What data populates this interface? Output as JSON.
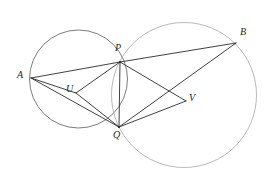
{
  "figure": {
    "name": "two-intersecting-circles-diagram",
    "background_color": "#ffffff",
    "width": 272,
    "height": 187
  },
  "style": {
    "circle_left_color": "#5a5a5a",
    "circle_right_color": "#a8a8a8",
    "chord_color": "#2b2b2b",
    "label_color": "#231f20",
    "circle_stroke_width": 0.8,
    "chord_stroke_width": 0.9,
    "label_font_size": 10
  },
  "circles": [
    {
      "id": "circle-left",
      "label": "left circle",
      "cx": 78.5,
      "cy": 79.0,
      "r": 49.0,
      "color": "#5a5a5a"
    },
    {
      "id": "circle-right",
      "label": "right circle",
      "cx": 184.0,
      "cy": 95.0,
      "r": 72.5,
      "color": "#a8a8a8"
    }
  ],
  "points": [
    {
      "id": "A",
      "label": "A",
      "x": 31.0,
      "y": 78.0,
      "label_x": 17,
      "label_y": 70
    },
    {
      "id": "P",
      "label": "P",
      "x": 120.0,
      "y": 62.0,
      "label_x": 115,
      "label_y": 43
    },
    {
      "id": "Q",
      "label": "Q",
      "x": 119.0,
      "y": 127.0,
      "label_x": 113,
      "label_y": 130
    },
    {
      "id": "B",
      "label": "B",
      "x": 236.0,
      "y": 43.0,
      "label_x": 240,
      "label_y": 27
    },
    {
      "id": "U",
      "label": "U",
      "x": 76.0,
      "y": 93.0,
      "label_x": 66,
      "label_y": 84
    },
    {
      "id": "V",
      "label": "V",
      "x": 186.0,
      "y": 101.0,
      "label_x": 189,
      "label_y": 93
    }
  ],
  "segments": [
    {
      "id": "seg-AP",
      "from": "A",
      "to": "P",
      "label": "A to P"
    },
    {
      "id": "seg-AU",
      "from": "A",
      "to": "U",
      "label": "A to U"
    },
    {
      "id": "seg-AQ",
      "from": "A",
      "to": "Q",
      "label": "A to Q"
    },
    {
      "id": "seg-UP",
      "from": "U",
      "to": "P",
      "label": "U to P"
    },
    {
      "id": "seg-UQ",
      "from": "U",
      "to": "Q",
      "label": "U to Q"
    },
    {
      "id": "seg-PQ",
      "from": "P",
      "to": "Q",
      "label": "P to Q"
    },
    {
      "id": "seg-PB",
      "from": "P",
      "to": "B",
      "label": "P to B"
    },
    {
      "id": "seg-PV",
      "from": "P",
      "to": "V",
      "label": "P to V"
    },
    {
      "id": "seg-QV",
      "from": "Q",
      "to": "V",
      "label": "Q to V"
    },
    {
      "id": "seg-QB",
      "from": "Q",
      "to": "B",
      "label": "Q to B"
    }
  ],
  "chart_data": {
    "type": "diagram",
    "title": "",
    "vertices": {
      "A": [
        31.0,
        78.0
      ],
      "P": [
        120.0,
        62.0
      ],
      "Q": [
        119.0,
        127.0
      ],
      "B": [
        236.0,
        43.0
      ],
      "U": [
        76.0,
        93.0
      ],
      "V": [
        186.0,
        101.0
      ]
    },
    "circles": [
      {
        "center": [
          78.5,
          79.0
        ],
        "radius": 49.0
      },
      {
        "center": [
          184.0,
          95.0
        ],
        "radius": 72.5
      }
    ],
    "edges": [
      [
        "A",
        "P"
      ],
      [
        "A",
        "U"
      ],
      [
        "A",
        "Q"
      ],
      [
        "U",
        "P"
      ],
      [
        "U",
        "Q"
      ],
      [
        "P",
        "Q"
      ],
      [
        "P",
        "B"
      ],
      [
        "P",
        "V"
      ],
      [
        "Q",
        "V"
      ],
      [
        "Q",
        "B"
      ]
    ]
  }
}
